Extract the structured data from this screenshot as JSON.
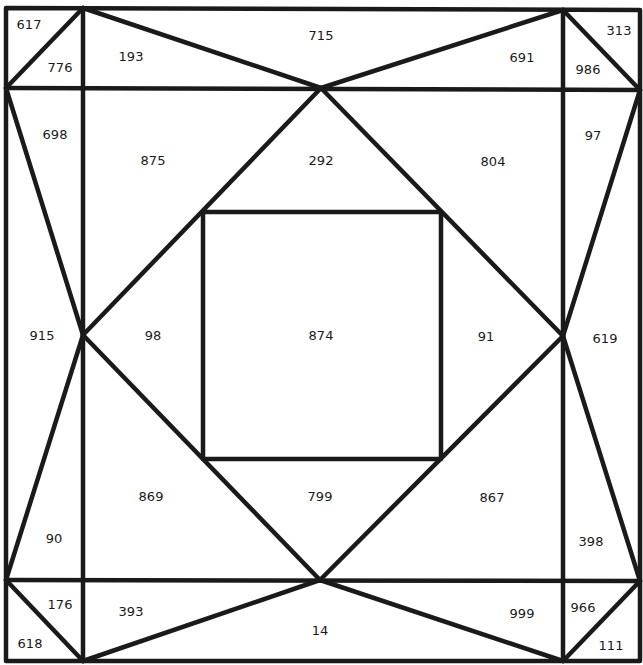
{
  "diagram": {
    "stroke_color": "#1a1a1a",
    "background": "#ffffff",
    "regions": [
      {
        "id": "r0",
        "label": "617",
        "x": 29,
        "y": 24
      },
      {
        "id": "r1",
        "label": "776",
        "x": 60,
        "y": 67
      },
      {
        "id": "r2",
        "label": "193",
        "x": 131,
        "y": 56
      },
      {
        "id": "r3",
        "label": "715",
        "x": 321,
        "y": 35
      },
      {
        "id": "r4",
        "label": "691",
        "x": 522,
        "y": 57
      },
      {
        "id": "r5",
        "label": "313",
        "x": 619,
        "y": 30
      },
      {
        "id": "r6",
        "label": "986",
        "x": 588,
        "y": 69
      },
      {
        "id": "r7",
        "label": "698",
        "x": 55,
        "y": 134
      },
      {
        "id": "r8",
        "label": "875",
        "x": 153,
        "y": 160
      },
      {
        "id": "r9",
        "label": "292",
        "x": 321,
        "y": 160
      },
      {
        "id": "r10",
        "label": "804",
        "x": 493,
        "y": 161
      },
      {
        "id": "r11",
        "label": "97",
        "x": 593,
        "y": 135
      },
      {
        "id": "r12",
        "label": "915",
        "x": 42,
        "y": 335
      },
      {
        "id": "r13",
        "label": "98",
        "x": 153,
        "y": 335
      },
      {
        "id": "r14",
        "label": "874",
        "x": 321,
        "y": 335
      },
      {
        "id": "r15",
        "label": "91",
        "x": 486,
        "y": 336
      },
      {
        "id": "r16",
        "label": "619",
        "x": 605,
        "y": 338
      },
      {
        "id": "r17",
        "label": "869",
        "x": 151,
        "y": 496
      },
      {
        "id": "r18",
        "label": "799",
        "x": 320,
        "y": 496
      },
      {
        "id": "r19",
        "label": "867",
        "x": 492,
        "y": 497
      },
      {
        "id": "r20",
        "label": "90",
        "x": 54,
        "y": 538
      },
      {
        "id": "r21",
        "label": "398",
        "x": 591,
        "y": 541
      },
      {
        "id": "r22",
        "label": "176",
        "x": 60,
        "y": 604
      },
      {
        "id": "r23",
        "label": "393",
        "x": 131,
        "y": 611
      },
      {
        "id": "r24",
        "label": "14",
        "x": 320,
        "y": 630
      },
      {
        "id": "r25",
        "label": "999",
        "x": 522,
        "y": 613
      },
      {
        "id": "r26",
        "label": "966",
        "x": 583,
        "y": 607
      },
      {
        "id": "r27",
        "label": "618",
        "x": 30,
        "y": 643
      },
      {
        "id": "r28",
        "label": "111",
        "x": 611,
        "y": 645
      }
    ]
  }
}
